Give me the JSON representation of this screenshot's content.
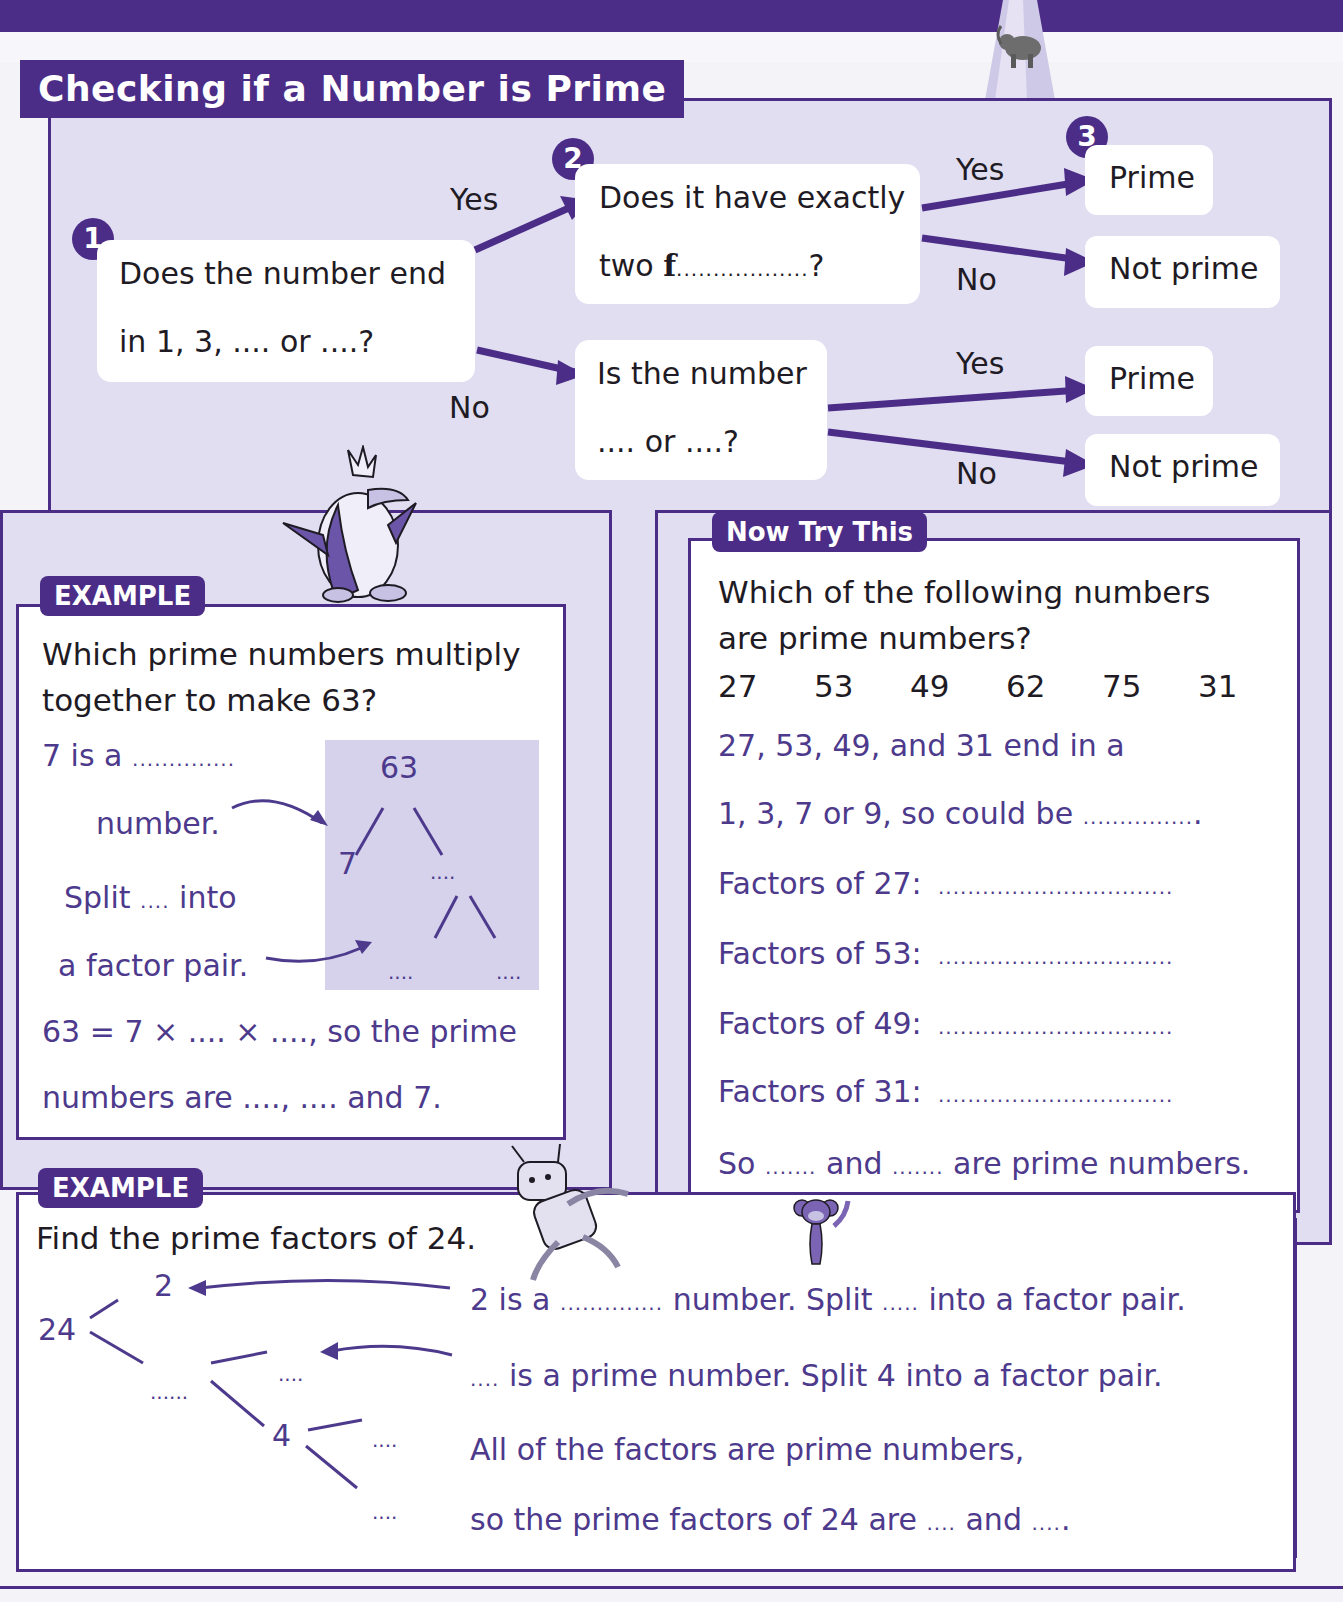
{
  "page": {
    "title": "Checking if a Number is Prime",
    "colors": {
      "primary": "#4b2d87",
      "panel": "#e1def2",
      "tree_bg": "#d6d2ec",
      "answer_text": "#4d3a8c"
    }
  },
  "flowchart": {
    "step1": {
      "number": "1",
      "line1": "Does the number end",
      "line2": "in 1, 3, .... or ....?"
    },
    "step2": {
      "number": "2",
      "q1_line1": "Does it have exactly",
      "q1_line2_prefix": "two ",
      "q1_line2_bold": "f",
      "q1_line2_blank": "..................",
      "q1_line2_suffix": "?",
      "q2_line1": "Is the number",
      "q2_line2": ".... or ....?"
    },
    "step3": {
      "number": "3"
    },
    "branch_labels": {
      "step1_yes": "Yes",
      "step1_no": "No",
      "q1_yes": "Yes",
      "q1_no": "No",
      "q2_yes": "Yes",
      "q2_no": "No"
    },
    "results": {
      "q1_yes": "Prime",
      "q1_no": "Not prime",
      "q2_yes": "Prime",
      "q2_no": "Not prime"
    }
  },
  "example1": {
    "tag": "EXAMPLE",
    "question_line1": "Which prime numbers multiply",
    "question_line2": "together to make 63?",
    "step_a_line1": "7 is a",
    "step_a_blank": "..............",
    "step_a_line2": "number.",
    "step_b_line1_prefix": "Split",
    "step_b_line1_blank": "....",
    "step_b_line1_suffix": "into",
    "step_b_line2": "a factor pair.",
    "conclusion_line1": "63 = 7 × .... × ...., so the prime",
    "conclusion_line2": "numbers are ...., .... and 7.",
    "tree": {
      "root": "63",
      "left": "7",
      "right": "....",
      "right_left": "....",
      "right_right": "...."
    }
  },
  "now_try_this": {
    "tag": "Now Try This",
    "question_line1": "Which of the following numbers",
    "question_line2": "are prime numbers?",
    "numbers": [
      "27",
      "53",
      "49",
      "62",
      "75",
      "31"
    ],
    "hint_line1": "27, 53, 49, and 31 end in a",
    "hint_line2_prefix": "1, 3, 7 or 9, so could be",
    "hint_line2_blank": "...............",
    "hint_line2_suffix": ".",
    "factors": [
      {
        "label": "Factors of 27:",
        "blank": "................................"
      },
      {
        "label": "Factors of 53:",
        "blank": "................................"
      },
      {
        "label": "Factors of 49:",
        "blank": "................................"
      },
      {
        "label": "Factors of 31:",
        "blank": "................................"
      }
    ],
    "conclusion_prefix": "So",
    "conclusion_blank1": ".......",
    "conclusion_mid": "and",
    "conclusion_blank2": ".......",
    "conclusion_suffix": "are prime numbers."
  },
  "example2": {
    "tag": "EXAMPLE",
    "question": "Find the prime factors of 24.",
    "tree": {
      "root": "24",
      "first_left": "2",
      "first_right": "......",
      "second_left": "....",
      "second_right": "4",
      "third_left": "....",
      "third_right": "...."
    },
    "line1_prefix": "2 is a",
    "line1_blank1": "..............",
    "line1_mid": "number.  Split",
    "line1_blank2": ".....",
    "line1_suffix": "into a factor pair.",
    "line2_blank": "....",
    "line2_text": "is a prime number.  Split 4 into a factor pair.",
    "line3": "All of the factors are prime numbers,",
    "line4_prefix": "so the prime factors of 24 are",
    "line4_blank1": "....",
    "line4_mid": "and",
    "line4_blank2": "....",
    "line4_suffix": "."
  }
}
